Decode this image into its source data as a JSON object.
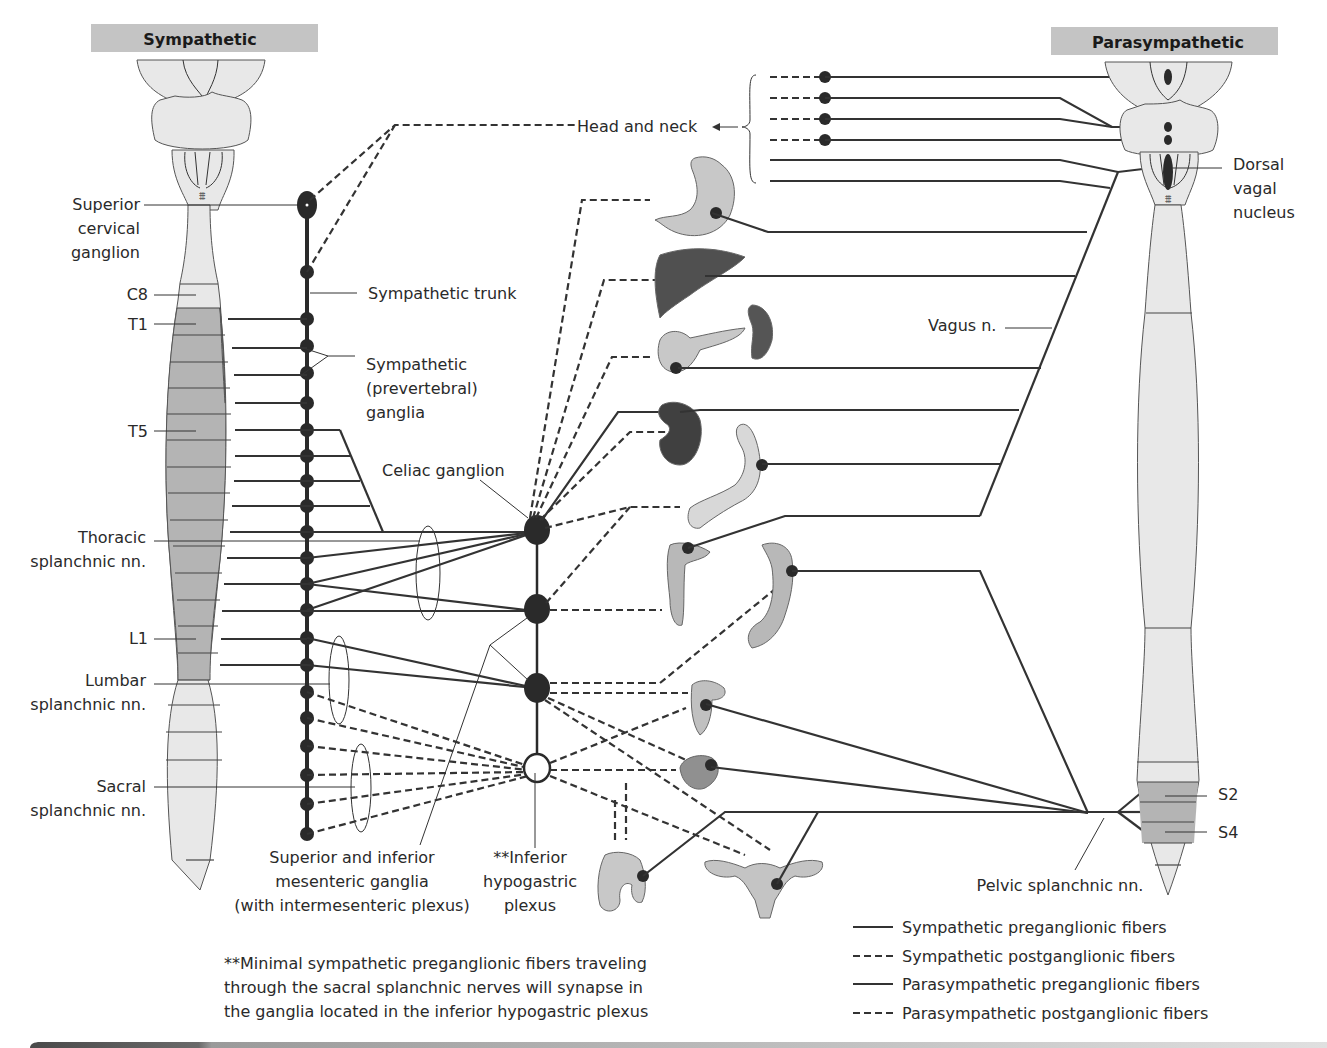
{
  "headers": {
    "sympathetic": "Sympathetic",
    "parasympathetic": "Parasympathetic"
  },
  "left_labels": {
    "superior_cervical": [
      "Superior",
      "cervical",
      "ganglion"
    ],
    "c8": "C8",
    "t1": "T1",
    "t5": "T5",
    "thoracic": [
      "Thoracic",
      "splanchnic nn."
    ],
    "l1": "L1",
    "lumbar": [
      "Lumbar",
      "splanchnic nn."
    ],
    "sacral": [
      "Sacral",
      "splanchnic nn."
    ]
  },
  "center_labels": {
    "sympathetic_trunk": "Sympathetic trunk",
    "prevertebral": [
      "Sympathetic",
      "(prevertebral)",
      "ganglia"
    ],
    "celiac": "Celiac ganglion",
    "head_neck": "Head and neck",
    "mesenteric": [
      "Superior and inferior",
      "mesenteric ganglia",
      "(with intermesenteric plexus)"
    ],
    "hypogastric": [
      "**Inferior",
      "hypogastric",
      "plexus"
    ]
  },
  "right_labels": {
    "dorsal_vagal": [
      "Dorsal",
      "vagal",
      "nucleus"
    ],
    "vagus": "Vagus n.",
    "s2": "S2",
    "s4": "S4",
    "pelvic": "Pelvic splanchnic nn."
  },
  "footnote": [
    "**Minimal sympathetic preganglionic fibers traveling",
    "through the sacral splanchnic nerves will synapse in",
    "the ganglia located in the inferior hypogastric plexus"
  ],
  "legend": [
    {
      "style": "solid",
      "label": "Sympathetic preganglionic fibers"
    },
    {
      "style": "dashed",
      "label": "Sympathetic postganglionic fibers"
    },
    {
      "style": "solid",
      "label": "Parasympathetic preganglionic fibers"
    },
    {
      "style": "dashed",
      "label": "Parasympathetic postganglionic fibers"
    }
  ],
  "organs": [
    "stomach",
    "liver",
    "spleen",
    "pancreas",
    "kidney",
    "small-intestine",
    "ascending-colon",
    "descending-colon",
    "rectum",
    "bladder",
    "male-genitalia",
    "uterus"
  ],
  "colors": {
    "line": "#333333",
    "cord_light": "#e8e8e8",
    "cord_dark": "#b4b4b4",
    "header_bg": "#c4c4c4"
  }
}
